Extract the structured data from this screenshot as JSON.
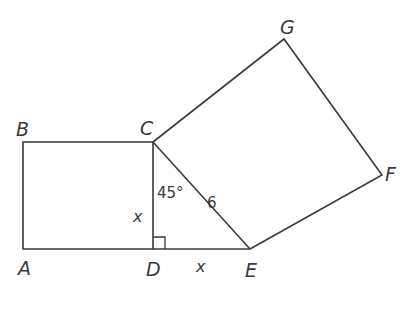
{
  "diagram": {
    "points": {
      "A": {
        "label": "A",
        "x": 23,
        "y": 249
      },
      "B": {
        "label": "B",
        "x": 23,
        "y": 142
      },
      "C": {
        "label": "C",
        "x": 153,
        "y": 142
      },
      "D": {
        "label": "D",
        "x": 153,
        "y": 249
      },
      "E": {
        "label": "E",
        "x": 250,
        "y": 249
      },
      "F": {
        "label": "F",
        "x": 382,
        "y": 175
      },
      "G": {
        "label": "G",
        "x": 284,
        "y": 39
      }
    },
    "labels": {
      "angle": "45°",
      "hypotenuse": "6",
      "side_cd": "x",
      "side_de": "x"
    },
    "shapes": [
      {
        "name": "square-ABCD",
        "vertices": [
          "A",
          "B",
          "C",
          "D"
        ]
      },
      {
        "name": "triangle-CDE",
        "vertices": [
          "C",
          "D",
          "E"
        ],
        "right_angle_at": "D"
      },
      {
        "name": "square-CEFG",
        "vertices": [
          "C",
          "E",
          "F",
          "G"
        ]
      }
    ],
    "colors": {
      "stroke": "#3a3a3a",
      "background": "#ffffff"
    }
  }
}
